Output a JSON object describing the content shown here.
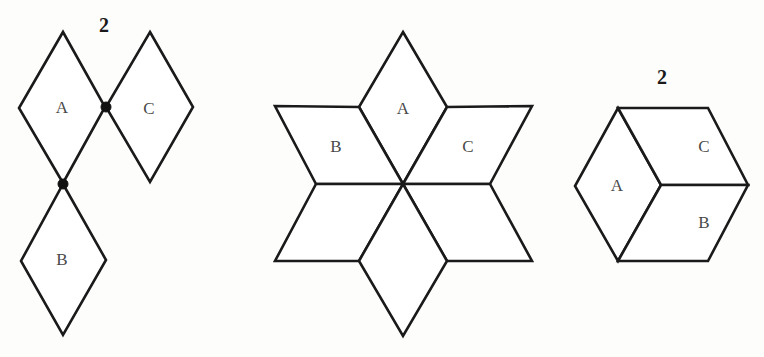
{
  "page": {
    "background_color": "#fdfdfc",
    "stroke_color": "#1a1a1a",
    "label_color": "#4a4a4a",
    "width": 764,
    "height": 357
  },
  "figures": [
    {
      "id": "figure-left",
      "name": "three-rhombi-chain",
      "count_label": "2",
      "count_label_pos": {
        "x": 104,
        "y": 27
      },
      "pieces": [
        {
          "label": "A",
          "label_pos": {
            "x": 62,
            "y": 109
          },
          "points": "63,32 105,107 63,183 19,108"
        },
        {
          "label": "B",
          "label_pos": {
            "x": 62,
            "y": 261
          },
          "points": "63,184 106,260 63,335 21,261"
        },
        {
          "label": "C",
          "label_pos": {
            "x": 149,
            "y": 110
          },
          "points": "150,32 193,107 150,182 106,107"
        }
      ],
      "vertex_dots": [
        {
          "x": 106,
          "y": 107,
          "r": 5
        },
        {
          "x": 63,
          "y": 184,
          "r": 5
        }
      ]
    },
    {
      "id": "figure-middle",
      "name": "six-pointed-star-hexagram",
      "count_label": "",
      "center": {
        "x": 403,
        "y": 184
      },
      "pieces": [
        {
          "label": "A",
          "label_pos": {
            "x": 403,
            "y": 110
          },
          "points": "403,32 447,107 403,184 359,107"
        },
        {
          "label": "B",
          "label_pos": {
            "x": 336,
            "y": 148
          },
          "points": "359,107 403,184 316,184 275,106"
        },
        {
          "label": "C",
          "label_pos": {
            "x": 468,
            "y": 148
          },
          "points": "447,107 532,106 490,184 403,184"
        },
        {
          "label": "",
          "label_pos": {
            "x": 336,
            "y": 222
          },
          "points": "316,184 403,184 359,261 275,261"
        },
        {
          "label": "",
          "label_pos": {
            "x": 468,
            "y": 222
          },
          "points": "403,184 490,184 532,261 447,261"
        },
        {
          "label": "",
          "label_pos": {
            "x": 403,
            "y": 258
          },
          "points": "403,184 447,261 403,336 359,261"
        }
      ],
      "vertex_dots": []
    },
    {
      "id": "figure-right",
      "name": "hexagon-cube-three-rhombi",
      "count_label": "2",
      "count_label_pos": {
        "x": 662,
        "y": 79
      },
      "pieces": [
        {
          "label": "A",
          "label_pos": {
            "x": 617,
            "y": 187
          },
          "points": "618,108 661,185 618,261 575,186"
        },
        {
          "label": "C",
          "label_pos": {
            "x": 704,
            "y": 148
          },
          "points": "618,108 708,108 748,185 661,185"
        },
        {
          "label": "B",
          "label_pos": {
            "x": 704,
            "y": 224
          },
          "points": "661,185 748,185 708,261 618,261"
        }
      ],
      "vertex_dots": []
    }
  ]
}
